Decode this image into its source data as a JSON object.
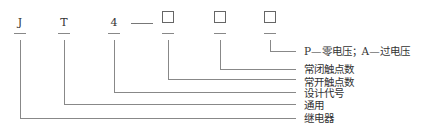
{
  "diagram": {
    "type": "model-number-breakdown",
    "code_positions": [
      {
        "symbol": "J",
        "meaning": "继电器"
      },
      {
        "symbol": "T",
        "meaning": "通用"
      },
      {
        "symbol": "4",
        "meaning": "设计代号"
      },
      {
        "symbol": "□",
        "meaning": "常开触点数"
      },
      {
        "symbol": "□",
        "meaning": "常闭触点数"
      },
      {
        "symbol": "□",
        "meaning": "P—零电压；A—过电压"
      }
    ],
    "separator": "—",
    "labels": {
      "box3": "P—零电压；A—过电压",
      "box2": "常闭触点数",
      "box1": "常开触点数",
      "digit4": "设计代号",
      "letterT": "通用",
      "letterJ": "继电器"
    },
    "codes": {
      "J": "J",
      "T": "T",
      "digit": "4"
    },
    "colors": {
      "line": "#888888",
      "text": "#333333",
      "box_border": "#666666"
    }
  }
}
